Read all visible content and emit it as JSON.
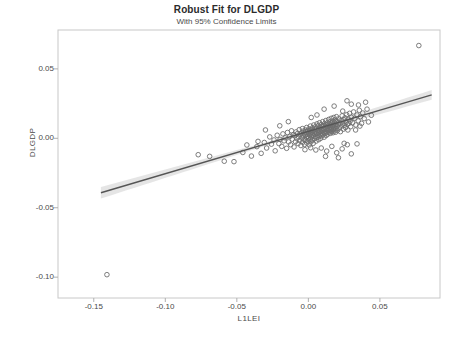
{
  "chart_data": {
    "type": "scatter",
    "title": "Robust Fit for DLGDP",
    "subtitle": "With 95% Confidence Limits",
    "xlabel": "L1LEI",
    "ylabel": "DLGDP",
    "xlim": [
      -0.175,
      0.092
    ],
    "ylim": [
      -0.115,
      0.078
    ],
    "xticks": [
      -0.15,
      -0.1,
      -0.05,
      0.0,
      0.05
    ],
    "xtick_labels": [
      "-0.15",
      "-0.10",
      "-0.05",
      "0.00",
      "0.05"
    ],
    "yticks": [
      0.05,
      0.0,
      -0.05,
      -0.1
    ],
    "ytick_labels": [
      "0.05",
      "0.00",
      "-0.05",
      "-0.10"
    ],
    "grid": false,
    "legend": "none",
    "marker": "open-circle",
    "marker_color": "#6e6e6e",
    "fit_line_color": "#555555",
    "confidence_band_color": "#cfcfcf",
    "fit": {
      "type": "robust-linear",
      "x_start": -0.145,
      "y_start": -0.0392,
      "x_end": 0.0862,
      "y_end": 0.0313,
      "slope": 0.3048,
      "intercept": 0.00499
    },
    "confidence_band_halfwidth": {
      "at_x_min": 0.0042,
      "at_x_center": 0.0012,
      "at_x_max": 0.0035
    },
    "points": [
      [
        -0.1408,
        -0.0982
      ],
      [
        0.0772,
        0.0668
      ],
      [
        -0.077,
        -0.0118
      ],
      [
        -0.069,
        -0.013
      ],
      [
        -0.0588,
        -0.0165
      ],
      [
        -0.052,
        -0.0168
      ],
      [
        -0.0458,
        -0.0102
      ],
      [
        -0.043,
        -0.0048
      ],
      [
        -0.0398,
        -0.0128
      ],
      [
        -0.036,
        -0.006
      ],
      [
        -0.0352,
        -0.0022
      ],
      [
        -0.033,
        -0.0108
      ],
      [
        -0.0308,
        -0.003
      ],
      [
        -0.0292,
        -0.007
      ],
      [
        -0.027,
        0.001
      ],
      [
        -0.0258,
        -0.0042
      ],
      [
        -0.024,
        -0.0012
      ],
      [
        -0.0232,
        -0.009
      ],
      [
        -0.0218,
        0.0022
      ],
      [
        -0.0206,
        -0.0038
      ],
      [
        -0.0198,
        -0.0008
      ],
      [
        -0.0186,
        -0.0058
      ],
      [
        -0.0178,
        0.0032
      ],
      [
        -0.017,
        -0.0018
      ],
      [
        -0.0162,
        0.0004
      ],
      [
        -0.0152,
        -0.0072
      ],
      [
        -0.0146,
        0.0042
      ],
      [
        -0.0138,
        -0.0026
      ],
      [
        -0.013,
        0.0014
      ],
      [
        -0.0124,
        -0.0046
      ],
      [
        -0.0118,
        0.0054
      ],
      [
        -0.0112,
        -0.0006
      ],
      [
        -0.0106,
        0.0026
      ],
      [
        -0.01,
        -0.0062
      ],
      [
        -0.0096,
        0.0018
      ],
      [
        -0.009,
        -0.0024
      ],
      [
        -0.0086,
        0.0046
      ],
      [
        -0.008,
        -0.0002
      ],
      [
        -0.0076,
        0.0034
      ],
      [
        -0.0072,
        -0.0038
      ],
      [
        -0.0068,
        0.001
      ],
      [
        -0.0064,
        0.0062
      ],
      [
        -0.006,
        -0.0016
      ],
      [
        -0.0056,
        0.0028
      ],
      [
        -0.0052,
        -0.0052
      ],
      [
        -0.0048,
        0.004
      ],
      [
        -0.0046,
        0.0002
      ],
      [
        -0.0042,
        0.007
      ],
      [
        -0.004,
        -0.0028
      ],
      [
        -0.0036,
        0.0016
      ],
      [
        -0.0034,
        0.0052
      ],
      [
        -0.003,
        -0.0008
      ],
      [
        -0.0028,
        0.0036
      ],
      [
        -0.0026,
        -0.0044
      ],
      [
        -0.0022,
        0.0024
      ],
      [
        -0.002,
        0.006
      ],
      [
        -0.0018,
        -0.0014
      ],
      [
        -0.0016,
        0.0044
      ],
      [
        -0.0014,
        0.0006
      ],
      [
        -0.0012,
        0.0078
      ],
      [
        -0.001,
        -0.0034
      ],
      [
        -0.0008,
        0.003
      ],
      [
        -0.0006,
        0.0014
      ],
      [
        -0.0004,
        0.0056
      ],
      [
        -0.0002,
        -0.002
      ],
      [
        0.0,
        0.0038
      ],
      [
        0.0002,
        0.0002
      ],
      [
        0.0004,
        0.0068
      ],
      [
        0.0006,
        -0.0048
      ],
      [
        0.0008,
        0.0022
      ],
      [
        0.001,
        0.005
      ],
      [
        0.0012,
        -0.0006
      ],
      [
        0.0014,
        0.0088
      ],
      [
        0.0016,
        0.0032
      ],
      [
        0.0018,
        -0.0026
      ],
      [
        0.002,
        0.0062
      ],
      [
        0.0022,
        0.001
      ],
      [
        0.0024,
        0.0044
      ],
      [
        0.0026,
        -0.0014
      ],
      [
        0.0028,
        0.0074
      ],
      [
        0.003,
        0.0026
      ],
      [
        0.0032,
        0.0054
      ],
      [
        0.0034,
        -0.0036
      ],
      [
        0.0036,
        0.0018
      ],
      [
        0.0038,
        0.0096
      ],
      [
        0.004,
        0.004
      ],
      [
        0.0042,
        -0.0002
      ],
      [
        0.0044,
        0.0066
      ],
      [
        0.0046,
        0.003
      ],
      [
        0.0048,
        0.0082
      ],
      [
        0.005,
        0.0012
      ],
      [
        0.0052,
        0.0048
      ],
      [
        0.0054,
        -0.002
      ],
      [
        0.0056,
        0.0072
      ],
      [
        0.0058,
        0.0034
      ],
      [
        0.006,
        0.0104
      ],
      [
        0.0062,
        0.0006
      ],
      [
        0.0064,
        0.0058
      ],
      [
        0.0066,
        0.0024
      ],
      [
        0.0068,
        0.009
      ],
      [
        0.007,
        0.0042
      ],
      [
        0.0072,
        -0.001
      ],
      [
        0.0074,
        0.0068
      ],
      [
        0.0076,
        0.0016
      ],
      [
        0.0078,
        0.0112
      ],
      [
        0.008,
        0.005
      ],
      [
        0.0082,
        0.003
      ],
      [
        0.0084,
        0.0078
      ],
      [
        0.0086,
        0.0
      ],
      [
        0.0088,
        0.006
      ],
      [
        0.009,
        0.0098
      ],
      [
        0.0092,
        0.0038
      ],
      [
        0.0094,
        0.0018
      ],
      [
        0.0096,
        0.0086
      ],
      [
        0.0098,
        0.0054
      ],
      [
        0.01,
        0.012
      ],
      [
        0.0102,
        0.0026
      ],
      [
        0.0104,
        0.007
      ],
      [
        0.0106,
        0.0044
      ],
      [
        0.0108,
        0.0092
      ],
      [
        0.011,
        0.0008
      ],
      [
        0.0112,
        0.0062
      ],
      [
        0.0114,
        0.0106
      ],
      [
        0.0116,
        0.0034
      ],
      [
        0.0118,
        0.008
      ],
      [
        0.012,
        0.005
      ],
      [
        0.0122,
        0.0128
      ],
      [
        0.0124,
        0.002
      ],
      [
        0.0126,
        0.0074
      ],
      [
        0.0128,
        0.0096
      ],
      [
        0.013,
        0.0042
      ],
      [
        0.0132,
        0.0064
      ],
      [
        0.0134,
        0.0112
      ],
      [
        0.0136,
        0.003
      ],
      [
        0.0138,
        0.0086
      ],
      [
        0.014,
        0.0056
      ],
      [
        0.0142,
        0.0136
      ],
      [
        0.0144,
        0.007
      ],
      [
        0.0146,
        0.01
      ],
      [
        0.0148,
        0.0046
      ],
      [
        0.015,
        0.0078
      ],
      [
        0.0152,
        0.0118
      ],
      [
        0.0154,
        0.0036
      ],
      [
        0.0156,
        0.009
      ],
      [
        0.0158,
        0.006
      ],
      [
        0.016,
        0.0144
      ],
      [
        0.0162,
        0.0074
      ],
      [
        0.0164,
        0.0108
      ],
      [
        0.0166,
        0.005
      ],
      [
        0.0168,
        0.0084
      ],
      [
        0.017,
        0.0124
      ],
      [
        0.0172,
        0.004
      ],
      [
        0.0174,
        0.0096
      ],
      [
        0.0176,
        0.0066
      ],
      [
        0.0178,
        0.015
      ],
      [
        0.018,
        0.008
      ],
      [
        0.0182,
        0.0114
      ],
      [
        0.0184,
        0.0054
      ],
      [
        0.0186,
        0.0092
      ],
      [
        0.0188,
        0.0132
      ],
      [
        0.019,
        0.0044
      ],
      [
        0.0192,
        0.0102
      ],
      [
        0.0194,
        0.007
      ],
      [
        0.0196,
        0.0156
      ],
      [
        0.0198,
        0.0086
      ],
      [
        0.02,
        0.012
      ],
      [
        0.0204,
        0.0058
      ],
      [
        0.0208,
        0.0098
      ],
      [
        0.0212,
        0.014
      ],
      [
        0.0216,
        0.0074
      ],
      [
        0.022,
        0.011
      ],
      [
        0.0224,
        0.0048
      ],
      [
        0.0228,
        0.0128
      ],
      [
        0.0232,
        0.0088
      ],
      [
        0.0236,
        0.0162
      ],
      [
        0.024,
        0.0104
      ],
      [
        0.0244,
        0.0066
      ],
      [
        0.0248,
        0.0134
      ],
      [
        0.0252,
        0.0094
      ],
      [
        0.0256,
        0.0148
      ],
      [
        0.026,
        0.0078
      ],
      [
        0.0264,
        0.0116
      ],
      [
        0.0268,
        0.017
      ],
      [
        0.0272,
        0.01
      ],
      [
        0.0276,
        0.006
      ],
      [
        0.028,
        0.0138
      ],
      [
        0.0284,
        0.0108
      ],
      [
        0.0288,
        0.018
      ],
      [
        0.0292,
        0.0124
      ],
      [
        0.0296,
        0.0084
      ],
      [
        0.03,
        0.0152
      ],
      [
        0.0308,
        0.0112
      ],
      [
        0.0316,
        0.019
      ],
      [
        0.0324,
        0.0144
      ],
      [
        0.0332,
        0.0096
      ],
      [
        0.034,
        0.0168
      ],
      [
        0.0348,
        0.0126
      ],
      [
        0.0356,
        0.0202
      ],
      [
        0.0364,
        0.0156
      ],
      [
        0.0372,
        0.0108
      ],
      [
        0.038,
        0.0182
      ],
      [
        0.0052,
        -0.0084
      ],
      [
        0.009,
        -0.007
      ],
      [
        0.0128,
        -0.0092
      ],
      [
        0.0164,
        -0.0058
      ],
      [
        0.0198,
        -0.0104
      ],
      [
        0.0236,
        -0.0076
      ],
      [
        0.0272,
        -0.0046
      ],
      [
        0.03,
        -0.0112
      ],
      [
        0.0016,
        -0.0068
      ],
      [
        -0.0024,
        -0.0082
      ],
      [
        0.012,
        -0.013
      ],
      [
        0.021,
        -0.014
      ],
      [
        0.025,
        -0.0036
      ],
      [
        0.034,
        -0.004
      ],
      [
        0.011,
        0.021
      ],
      [
        0.018,
        0.0232
      ],
      [
        0.024,
        0.0196
      ],
      [
        0.006,
        0.0168
      ],
      [
        0.03,
        0.0246
      ],
      [
        0.002,
        0.015
      ],
      [
        -0.014,
        0.012
      ],
      [
        -0.02,
        0.009
      ],
      [
        -0.03,
        0.006
      ],
      [
        0.041,
        0.021
      ],
      [
        0.044,
        0.0166
      ],
      [
        0.039,
        0.0142
      ],
      [
        0.036,
        0.0088
      ],
      [
        0.042,
        0.0118
      ],
      [
        0.033,
        0.006
      ],
      [
        0.027,
        0.027
      ],
      [
        0.035,
        0.024
      ],
      [
        0.04,
        0.026
      ]
    ]
  }
}
